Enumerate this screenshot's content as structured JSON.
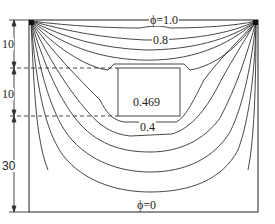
{
  "figure": {
    "type": "potential contour plot",
    "labels": {
      "top_boundary": "ϕ=1.0",
      "contour_08": "0.8",
      "inner_region": "0.469",
      "contour_04": "0.4",
      "bottom_boundary": "ϕ=0"
    },
    "dimensions": [
      {
        "label": "10",
        "segment": "top"
      },
      {
        "label": "10",
        "segment": "middle"
      },
      {
        "label": "30",
        "segment": "bottom"
      }
    ],
    "colors": {
      "line": "#333333",
      "background": "#ffffff"
    }
  }
}
